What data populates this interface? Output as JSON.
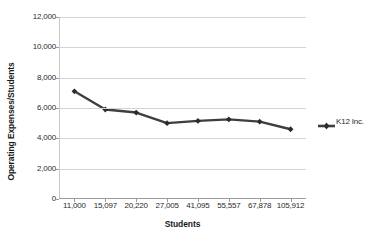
{
  "chart_data": {
    "type": "line",
    "title": "",
    "xlabel": "Students",
    "ylabel": "Operating Expenses/Students",
    "categories": [
      "11,000",
      "15,097",
      "20,220",
      "27,005",
      "41,095",
      "55,557",
      "67,878",
      "105,912"
    ],
    "series": [
      {
        "name": "K12 Inc.",
        "values": [
          7100,
          5900,
          5700,
          5000,
          5150,
          5250,
          5100,
          4600
        ],
        "color": "#3f3f3f",
        "marker": "diamond"
      }
    ],
    "ylim": [
      0,
      12000
    ],
    "yticks": [
      0,
      2000,
      4000,
      6000,
      8000,
      10000,
      12000
    ],
    "ytick_labels": [
      "0",
      "2,000",
      "4,000",
      "6,000",
      "8,000",
      "10,000",
      "12,000"
    ],
    "grid": true,
    "grid_axis": "y",
    "grid_color": "#d4d4d4",
    "legend_position": "right",
    "legend_entries": [
      "K12 Inc."
    ],
    "plot_background": "#ffffff"
  }
}
